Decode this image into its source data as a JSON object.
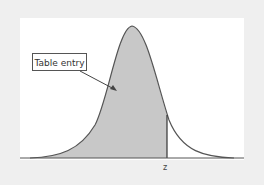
{
  "figure": {
    "type": "standard normal curve with shaded left-tail area",
    "annotation": "Table entry",
    "axis_label": "z",
    "colors": {
      "background": "#efefef",
      "panel": "#ffffff",
      "shade": "#c8c8c8",
      "curve": "#555555"
    }
  }
}
